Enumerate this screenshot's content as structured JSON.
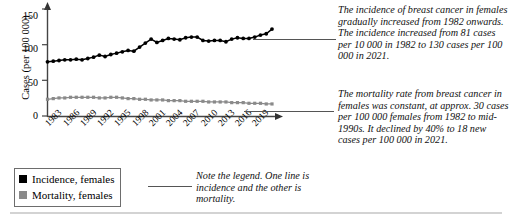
{
  "chart_data": {
    "type": "line",
    "title": "",
    "xlabel": "",
    "ylabel": "Cases (per 100 000)",
    "ylim": [
      0,
      160
    ],
    "yticks": [
      0,
      50,
      100,
      150
    ],
    "xlim": [
      1982,
      2021
    ],
    "xticks": [
      1983,
      1986,
      1989,
      1992,
      1995,
      1998,
      2001,
      2004,
      2007,
      2010,
      2013,
      2016,
      2019
    ],
    "grid": false,
    "legend_position": "below-left",
    "x": [
      1982,
      1983,
      1984,
      1985,
      1986,
      1987,
      1988,
      1989,
      1990,
      1991,
      1992,
      1993,
      1994,
      1995,
      1996,
      1997,
      1998,
      1999,
      2000,
      2001,
      2002,
      2003,
      2004,
      2005,
      2006,
      2007,
      2008,
      2009,
      2010,
      2011,
      2012,
      2013,
      2014,
      2015,
      2016,
      2017,
      2018,
      2019,
      2020,
      2021
    ],
    "series": [
      {
        "name": "Incidence, females",
        "color": "#000000",
        "marker": "filled-circle",
        "values": [
          81,
          82,
          83,
          84,
          84,
          85,
          84,
          86,
          88,
          91,
          89,
          92,
          94,
          96,
          98,
          97,
          103,
          109,
          115,
          110,
          113,
          116,
          115,
          114,
          117,
          118,
          118,
          113,
          112,
          113,
          113,
          111,
          115,
          117,
          116,
          116,
          118,
          121,
          123,
          130
        ]
      },
      {
        "name": "Mortality, females",
        "color": "#8a8a8a",
        "marker": "filled-square",
        "values": [
          25,
          26,
          27,
          27,
          28,
          28,
          28,
          28,
          28,
          27,
          27,
          28,
          28,
          27,
          26,
          26,
          25,
          25,
          24,
          24,
          24,
          23,
          23,
          23,
          22,
          22,
          22,
          22,
          21,
          21,
          21,
          21,
          20,
          20,
          20,
          19,
          19,
          19,
          18,
          18
        ]
      }
    ]
  },
  "legend": {
    "items": [
      {
        "label": "Incidence, females",
        "color": "#000000"
      },
      {
        "label": "Mortality, females",
        "color": "#8a8a8a"
      }
    ]
  },
  "annotations": {
    "incidence": "The incidence of breast cancer in females gradually increased from 1982 onwards. The incidence increased from 81 cases per 10 000 in 1982 to 130 cases per 100 000 in 2021.",
    "mortality": "The mortality rate from breast cancer in females was constant, at approx. 30 cases per 100 000 females from 1982 to mid-1990s. It declined by 40% to 18 new cases per 100 000 in 2021.",
    "legend_note": "Note the legend. One line is incidence and the other is mortality."
  }
}
